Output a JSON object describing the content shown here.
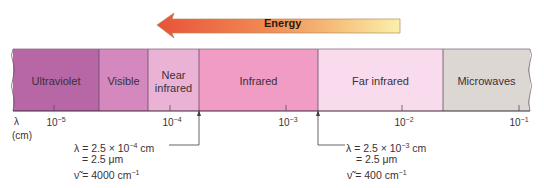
{
  "energy_arrow": {
    "label": "Energy",
    "direction": "left",
    "gradient_from": "#e8573a",
    "gradient_to": "#fbeea8"
  },
  "spectrum": {
    "regions": [
      {
        "name": "Ultraviolet",
        "line1": "Ultraviolet",
        "line2": "",
        "color": "#b766a6",
        "x0": 13,
        "x1": 99
      },
      {
        "name": "Visible",
        "line1": "Visible",
        "line2": "",
        "color": "#d488bd",
        "x0": 99,
        "x1": 148
      },
      {
        "name": "Near infrared",
        "line1": "Near",
        "line2": "infrared",
        "color": "#eab3d6",
        "x0": 148,
        "x1": 199
      },
      {
        "name": "Infrared",
        "line1": "Infrared",
        "line2": "",
        "color": "#f09cc4",
        "x0": 199,
        "x1": 318
      },
      {
        "name": "Far infrared",
        "line1": "Far infrared",
        "line2": "",
        "color": "#f8dced",
        "x0": 318,
        "x1": 443
      },
      {
        "name": "Microwaves",
        "line1": "Microwaves",
        "line2": "",
        "color": "#ddd7d3",
        "x0": 443,
        "x1": 530
      }
    ]
  },
  "axis": {
    "symbol": "λ",
    "unit": "(cm)",
    "ticks": [
      {
        "base": "10",
        "exp": "−5",
        "x": 54
      },
      {
        "base": "10",
        "exp": "−4",
        "x": 170
      },
      {
        "base": "10",
        "exp": "−3",
        "x": 286
      },
      {
        "base": "10",
        "exp": "−2",
        "x": 402
      },
      {
        "base": "10",
        "exp": "−1",
        "x": 519
      }
    ]
  },
  "annotations": {
    "left": {
      "line1_prefix": "λ = 2.5 × 10",
      "line1_exp": "−4",
      "line1_suffix": " cm",
      "line2": "= 2.5 μm",
      "line3_prefix": "ν̃ = 4000 cm",
      "line3_exp": "−1"
    },
    "right": {
      "line1_prefix": "λ = 2.5 × 10",
      "line1_exp": "−3",
      "line1_suffix": " cm",
      "line2": "= 2.5 μm",
      "line3_prefix": "ν̃ = 400 cm",
      "line3_exp": "−1"
    }
  }
}
